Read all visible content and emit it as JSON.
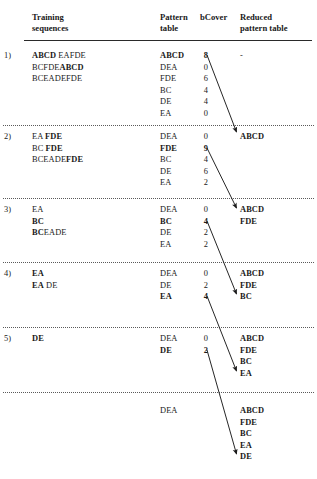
{
  "figure": {
    "columns": {
      "index": "",
      "training_sequences": "Training\nsequences",
      "training_sequences_l1": "Training",
      "training_sequences_l2": "sequences",
      "pattern_table_l1": "Pattern",
      "pattern_table_l2": "table",
      "bcover": "bCover",
      "reduced_l1": "Reduced",
      "reduced_l2": "pattern table"
    },
    "rows": [
      {
        "index": "1)",
        "sequences": [
          {
            "bold": "ABCD",
            "plain": "EAFDE"
          },
          {
            "bold2_prefix": "BCFDE",
            "bold2": "ABCD"
          },
          {
            "plain_only": "BCEADEFDE"
          }
        ],
        "seq_text": [
          "ABCD EAFDE",
          "BCFDEABCD",
          "BCEADEFDE"
        ],
        "patterns": [
          "ABCD",
          "DEA",
          "FDE",
          "BC",
          "DE",
          "EA"
        ],
        "pattern_bold_index": 0,
        "bcover": [
          "8",
          "0",
          "6",
          "4",
          "4",
          "0"
        ],
        "bcover_bold_index": 0,
        "reduced": [
          "-"
        ],
        "reduced_is_dash": true
      },
      {
        "index": "2)",
        "seq_text": [
          "EA FDE",
          "BC FDE",
          "BCEADEFDE"
        ],
        "patterns": [
          "DEA",
          "FDE",
          "BC",
          "DE",
          "EA"
        ],
        "pattern_bold_index": 1,
        "bcover": [
          "0",
          "9",
          "4",
          "6",
          "2"
        ],
        "bcover_bold_index": 1,
        "reduced": [
          "ABCD"
        ],
        "reduced_is_dash": false
      },
      {
        "index": "3)",
        "seq_text": [
          "EA",
          "BC",
          "BCEADE"
        ],
        "patterns": [
          "DEA",
          "BC",
          "DE",
          "EA"
        ],
        "pattern_bold_index": 1,
        "bcover": [
          "0",
          "4",
          "2",
          "2"
        ],
        "bcover_bold_index": 1,
        "reduced": [
          "ABCD",
          "FDE"
        ],
        "reduced_is_dash": false
      },
      {
        "index": "4)",
        "seq_text": [
          "EA",
          "EADE"
        ],
        "patterns": [
          "DEA",
          "DE",
          "EA"
        ],
        "pattern_bold_index": 2,
        "bcover": [
          "0",
          "2",
          "4"
        ],
        "bcover_bold_index": 2,
        "reduced": [
          "ABCD",
          "FDE",
          "BC"
        ],
        "reduced_is_dash": false
      },
      {
        "index": "5)",
        "seq_text": [
          "DE"
        ],
        "patterns": [
          "DEA",
          "DE"
        ],
        "pattern_bold_index": 1,
        "bcover": [
          "0",
          "2"
        ],
        "bcover_bold_index": 1,
        "reduced": [
          "ABCD",
          "FDE",
          "BC",
          "EA"
        ],
        "reduced_is_dash": false
      },
      {
        "index": "",
        "seq_text": [],
        "patterns": [
          "DEA"
        ],
        "pattern_bold_index": -1,
        "bcover": [],
        "bcover_bold_index": -1,
        "reduced": [
          "ABCD",
          "FDE",
          "BC",
          "EA",
          "DE"
        ],
        "reduced_is_dash": false
      }
    ],
    "colors": {
      "text": "#1a1a1a",
      "rule": "#2a2a2a",
      "dotted_rule": "#5a5a5a",
      "background": "#ffffff"
    }
  }
}
